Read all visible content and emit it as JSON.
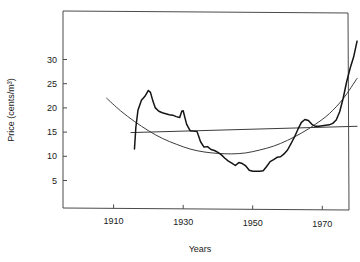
{
  "chart_data": {
    "type": "line",
    "title": "",
    "xlabel": "Years",
    "ylabel": "Price (cents/m³)",
    "xlim": [
      1900,
      1982
    ],
    "ylim": [
      0,
      37
    ],
    "grid": false,
    "legend": "none",
    "xticks": [
      1910,
      1930,
      1950,
      1970
    ],
    "xtick_labels": [
      "1910",
      "1930",
      "1950",
      "1970"
    ],
    "yticks": [
      5,
      10,
      15,
      20,
      25,
      30
    ],
    "ytick_labels": [
      "5",
      "10",
      "15",
      "20",
      "25",
      "30"
    ],
    "series": [
      {
        "name": "Price",
        "role": "observed",
        "x": [
          1916,
          1916.4,
          1917,
          1918,
          1919,
          1920,
          1920.6,
          1921.3,
          1922,
          1923,
          1924,
          1925,
          1926,
          1927,
          1928,
          1929,
          1929.6,
          1930,
          1930.5,
          1931,
          1932,
          1933,
          1934,
          1935,
          1936,
          1937,
          1938,
          1939,
          1940,
          1941,
          1942,
          1943,
          1944,
          1945,
          1946,
          1947,
          1948,
          1949,
          1950,
          1951,
          1952,
          1953,
          1954,
          1955,
          1956,
          1957,
          1958,
          1959,
          1960,
          1961,
          1962,
          1963,
          1964,
          1965,
          1966,
          1967,
          1968,
          1969,
          1970,
          1971,
          1972,
          1973,
          1974,
          1975,
          1976,
          1977,
          1978,
          1979,
          1980
        ],
        "y": [
          11.5,
          16.0,
          19.5,
          21.6,
          22.4,
          23.6,
          23.2,
          21.4,
          20.0,
          19.3,
          19.0,
          18.8,
          18.6,
          18.5,
          18.2,
          18.0,
          19.3,
          19.4,
          18.0,
          16.6,
          15.3,
          15.2,
          15.1,
          13.0,
          11.9,
          12.0,
          11.4,
          11.2,
          10.8,
          10.3,
          9.6,
          9.0,
          8.6,
          8.1,
          8.7,
          8.5,
          8.0,
          7.1,
          6.9,
          6.9,
          6.9,
          7.0,
          7.9,
          8.9,
          9.3,
          9.8,
          9.9,
          10.5,
          11.3,
          12.6,
          14.0,
          15.6,
          17.0,
          17.6,
          17.4,
          16.6,
          16.2,
          16.2,
          16.3,
          16.4,
          16.5,
          16.8,
          17.5,
          19.2,
          22.0,
          25.4,
          28.2,
          30.5,
          33.8
        ],
        "description": "observed price series with sharp rise to 1920 peak of about 23.6, long decline to a 1950 trough near 6.9, and a steep climb after 1975 reaching about 33.8 in 1980"
      },
      {
        "name": "Quadratic fit",
        "role": "smooth-fit",
        "x": [
          1908,
          1912,
          1916,
          1920,
          1924,
          1928,
          1932,
          1936,
          1940,
          1944,
          1948,
          1952,
          1956,
          1960,
          1964,
          1968,
          1972,
          1976,
          1980
        ],
        "y": [
          22.0,
          19.4,
          17.2,
          15.3,
          13.7,
          12.5,
          11.5,
          10.9,
          10.6,
          10.5,
          10.7,
          11.3,
          12.1,
          13.3,
          14.8,
          16.6,
          18.8,
          21.9,
          26.1
        ],
        "description": "smooth convex curve with minimum near 1944 at about 10.5"
      },
      {
        "name": "Linear trend",
        "role": "regression-line",
        "x": [
          1915,
          1980
        ],
        "y": [
          14.9,
          16.2
        ],
        "description": "nearly flat rising straight line across the plot"
      }
    ]
  },
  "axes": {
    "y_axis_label": "Price (cents/m³)",
    "x_axis_label": "Years"
  }
}
